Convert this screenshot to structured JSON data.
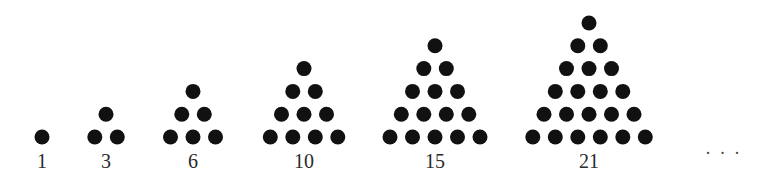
{
  "diagram": {
    "dot_color": "#111111",
    "label_color": "#2a2a2a",
    "dot_radius": 7.5,
    "spacing_x": 22.5,
    "spacing_y": 22.8,
    "baseline_y": 137,
    "figures": [
      {
        "label": "1",
        "rows": 1,
        "center_x": 42
      },
      {
        "label": "3",
        "rows": 2,
        "center_x": 106
      },
      {
        "label": "6",
        "rows": 3,
        "center_x": 193
      },
      {
        "label": "10",
        "rows": 4,
        "center_x": 304
      },
      {
        "label": "15",
        "rows": 5,
        "center_x": 435
      },
      {
        "label": "21",
        "rows": 6,
        "center_x": 589
      }
    ],
    "continuation": "· · ·"
  }
}
